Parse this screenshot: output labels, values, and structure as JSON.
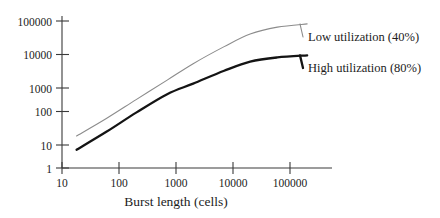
{
  "chart_data": {
    "type": "line",
    "title": "",
    "subtitle": "",
    "xlabel": "Burst length (cells)",
    "ylabel": "",
    "xscale": "log",
    "yscale": "log",
    "xlim": [
      10,
      300000
    ],
    "ylim": [
      1,
      200000
    ],
    "grid": false,
    "legend_position": "inline-right-annotations",
    "x_ticks": [
      10,
      100,
      1000,
      10000,
      100000
    ],
    "x_tick_labels": [
      "10",
      "100",
      "1000",
      "10000",
      "100000"
    ],
    "y_ticks": [
      1,
      10,
      100,
      1000,
      10000,
      100000
    ],
    "y_tick_labels": [
      "1",
      "10",
      "100",
      "1000",
      "10000",
      "100000"
    ],
    "series": [
      {
        "name": "Low utilization (40%)",
        "color": "#8c8c8c",
        "line_width": 1.1,
        "x": [
          18,
          60,
          200,
          700,
          2000,
          7000,
          20000,
          60000,
          200000
        ],
        "values": [
          9,
          30,
          110,
          420,
          1300,
          4200,
          10000,
          16000,
          20000
        ]
      },
      {
        "name": "High utilization (80%)",
        "color": "#141414",
        "line_width": 2.3,
        "x": [
          18,
          60,
          200,
          700,
          2000,
          7000,
          20000,
          60000,
          200000
        ],
        "values": [
          3.5,
          12,
          45,
          160,
          330,
          800,
          1500,
          2000,
          2300
        ]
      }
    ],
    "annotations": [
      {
        "text": "Low utilization (40%)",
        "series": "Low utilization (40%)"
      },
      {
        "text": "High utilization (80%)",
        "series": "High utilization (80%)"
      }
    ]
  },
  "axis": {
    "x_label": "Burst length (cells)",
    "x_tick_labels": [
      "10",
      "100",
      "1000",
      "10000",
      "100000"
    ],
    "y_tick_labels": [
      "100000",
      "10000",
      "1000",
      "100",
      "10",
      "1"
    ]
  },
  "labels": {
    "low_utilization": "Low utilization (40%)",
    "high_utilization": "High utilization (80%)"
  },
  "colors": {
    "low_series": "#8c8c8c",
    "high_series": "#141414",
    "axis": "#3a3a3a",
    "text": "#1c1c1c",
    "background": "#ffffff"
  }
}
